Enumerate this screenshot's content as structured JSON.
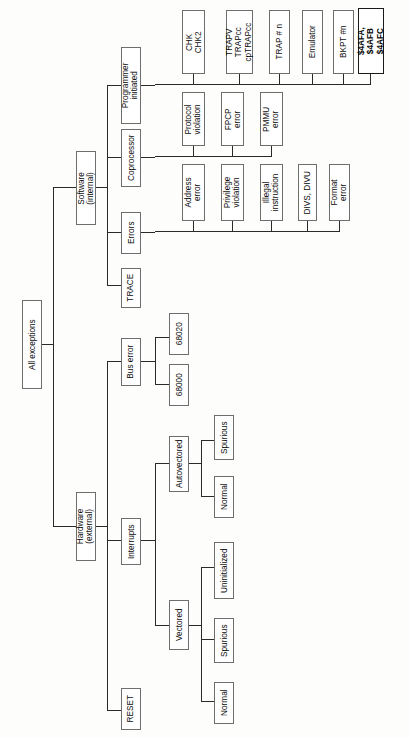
{
  "diagram": {
    "title": "All exceptions",
    "orientation": "rotated-90-tree",
    "root": {
      "label": "All exceptions"
    },
    "level1": [
      {
        "label": "Software\n(internal)"
      },
      {
        "label": "Hardware\n(external)"
      }
    ],
    "software_children": [
      {
        "label": "Programmer\ninitiated"
      },
      {
        "label": "Coprocessor"
      },
      {
        "label": "Errors"
      },
      {
        "label": "TRACE"
      }
    ],
    "hardware_children": [
      {
        "label": "Bus error"
      },
      {
        "label": "Interrupts"
      },
      {
        "label": "RESET"
      }
    ],
    "programmer_initiated_leaves": [
      {
        "label": "CHK\nCHK2",
        "bold": false
      },
      {
        "label": "TRAPV\nTRAPcc\ncpTRAPcc",
        "bold": false
      },
      {
        "label": "TRAP # n",
        "bold": false
      },
      {
        "label": "Emulator",
        "bold": false
      },
      {
        "label": "BKPT #n",
        "bold": false
      },
      {
        "label": "$4AFA,\n$4AFB\n$4AFC",
        "bold": true
      }
    ],
    "coprocessor_leaves": [
      {
        "label": "Protocol\nviolation"
      },
      {
        "label": "FPCP\nerror"
      },
      {
        "label": "PMMU\nerror"
      }
    ],
    "errors_leaves": [
      {
        "label": "Address\nerror"
      },
      {
        "label": "Privilege\nviolation"
      },
      {
        "label": "Illegal\ninstruction"
      },
      {
        "label": "DIVS, DIVU"
      },
      {
        "label": "Format\nerror"
      }
    ],
    "bus_error_leaves": [
      {
        "label": "68020"
      },
      {
        "label": "68000"
      }
    ],
    "interrupts_children": [
      {
        "label": "Autovectored"
      },
      {
        "label": "Vectored"
      }
    ],
    "autovectored_leaves": [
      {
        "label": "Spurious"
      },
      {
        "label": "Normal"
      }
    ],
    "vectored_leaves": [
      {
        "label": "Uninitialized"
      },
      {
        "label": "Spurious"
      },
      {
        "label": "Normal"
      }
    ],
    "colors": {
      "background": "#fdfdfc",
      "box_border": "#6e6e6e",
      "box_border_bold": "#1a1a1a",
      "line": "#2a2a2a",
      "text": "#0b0b0b"
    }
  }
}
